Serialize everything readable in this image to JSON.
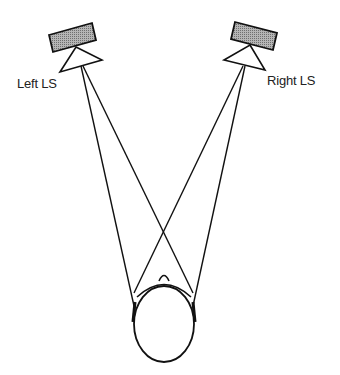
{
  "diagram": {
    "left_speaker": {
      "label": "Left LS"
    },
    "right_speaker": {
      "label": "Right LS"
    },
    "listener": {
      "label": ""
    },
    "colors": {
      "stroke": "#111111",
      "speaker_fill": "#9a9a9a",
      "background": "#ffffff"
    }
  }
}
